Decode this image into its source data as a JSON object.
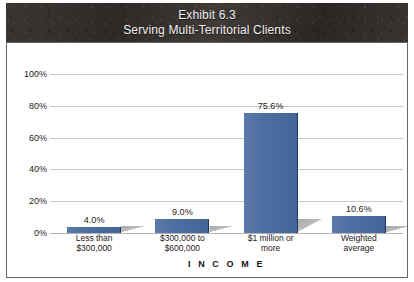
{
  "banner": {
    "line1": "Exhibit 6.3",
    "line2": "Serving Multi-Territorial Clients",
    "background_color": "#332e2c",
    "text_color": "#f2f1ef"
  },
  "chart_data": {
    "type": "bar",
    "xlabel": "I N C O M E",
    "ylabel": "",
    "categories": [
      "Less than $300,000",
      "$300,000 to $600,000",
      "$1 million or more",
      "Weighted average"
    ],
    "category_lines": [
      [
        "Less than",
        "$300,000"
      ],
      [
        "$300,000 to",
        "$600,000"
      ],
      [
        "$1 million or",
        "more"
      ],
      [
        "Weighted",
        "average"
      ]
    ],
    "values": [
      4.0,
      9.0,
      75.6,
      10.6
    ],
    "data_labels": [
      "4.0%",
      "9.0%",
      "75.6%",
      "10.6%"
    ],
    "ylim": [
      0,
      100
    ],
    "yticks": [
      0,
      20,
      40,
      60,
      80,
      100
    ],
    "ytick_labels": [
      "0%",
      "20%",
      "40%",
      "60%",
      "80%",
      "100%"
    ],
    "grid": true,
    "legend": false,
    "bar_color": "#46699f",
    "gridline_color": "#c9c7c5"
  }
}
